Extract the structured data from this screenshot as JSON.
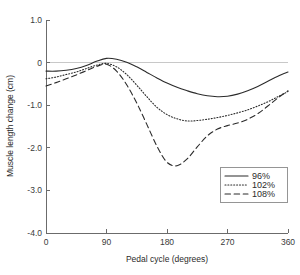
{
  "chart_data": {
    "type": "line",
    "title": "",
    "xlabel": "Pedal cycle (degrees)",
    "ylabel": "Muscle length change (cm)",
    "xlim": [
      0,
      360
    ],
    "ylim": [
      -4.0,
      1.0
    ],
    "xticks": [
      0,
      90,
      180,
      270,
      360
    ],
    "xtick_labels": [
      "0",
      "90",
      "180",
      "270",
      "360"
    ],
    "yticks": [
      1.0,
      0,
      -1.0,
      -2.0,
      -3.0,
      -4.0
    ],
    "ytick_labels": [
      "1.0",
      "0",
      "-1.0",
      "-2.0",
      "-3.0",
      "-4.0"
    ],
    "grid": false,
    "zero_reference_line": true,
    "legend_position": "lower-right",
    "x": [
      0,
      15,
      30,
      45,
      60,
      75,
      90,
      105,
      120,
      135,
      150,
      165,
      180,
      195,
      210,
      225,
      240,
      255,
      270,
      285,
      300,
      315,
      330,
      345,
      360
    ],
    "series": [
      {
        "name": "96%",
        "style": "solid",
        "color": "#2b2b2b",
        "values": [
          -0.2,
          -0.2,
          -0.18,
          -0.14,
          -0.07,
          0.03,
          0.1,
          0.08,
          0.01,
          -0.1,
          -0.23,
          -0.36,
          -0.48,
          -0.58,
          -0.66,
          -0.73,
          -0.78,
          -0.8,
          -0.79,
          -0.74,
          -0.66,
          -0.56,
          -0.44,
          -0.32,
          -0.22
        ]
      },
      {
        "name": "102%",
        "style": "dotted",
        "color": "#2b2b2b",
        "values": [
          -0.38,
          -0.34,
          -0.28,
          -0.22,
          -0.14,
          -0.06,
          -0.02,
          -0.1,
          -0.28,
          -0.53,
          -0.8,
          -1.05,
          -1.22,
          -1.32,
          -1.37,
          -1.36,
          -1.33,
          -1.29,
          -1.24,
          -1.18,
          -1.11,
          -1.02,
          -0.92,
          -0.8,
          -0.68
        ]
      },
      {
        "name": "108%",
        "style": "dashed",
        "color": "#2b2b2b",
        "values": [
          -0.55,
          -0.47,
          -0.38,
          -0.29,
          -0.19,
          -0.09,
          -0.04,
          -0.2,
          -0.52,
          -0.95,
          -1.45,
          -1.96,
          -2.34,
          -2.42,
          -2.26,
          -1.98,
          -1.72,
          -1.56,
          -1.48,
          -1.42,
          -1.33,
          -1.2,
          -1.02,
          -0.83,
          -0.66
        ]
      }
    ],
    "legend": [
      {
        "label": "96%",
        "style": "solid"
      },
      {
        "label": "102%",
        "style": "dotted"
      },
      {
        "label": "108%",
        "style": "dashed"
      }
    ]
  },
  "axes": {
    "x_title": "Pedal cycle (degrees)",
    "y_title": "Muscle length change (cm)"
  },
  "tick_text": {
    "y": [
      "1.0",
      "0",
      "-1.0",
      "-2.0",
      "-3.0",
      "-4.0"
    ],
    "x": [
      "0",
      "90",
      "180",
      "270",
      "360"
    ]
  },
  "legend_text": {
    "item0": "96%",
    "item1": "102%",
    "item2": "108%"
  }
}
